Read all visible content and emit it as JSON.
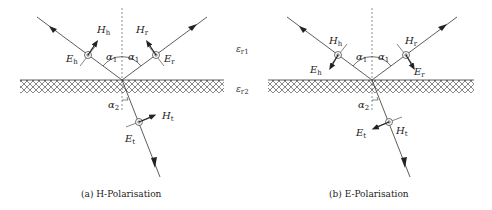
{
  "figure": {
    "media_labels": {
      "medium1": "ε",
      "medium1_sub": "r1",
      "medium2": "ε",
      "medium2_sub": "r2"
    },
    "panels": [
      {
        "id": "a",
        "caption": "(a) H-Polarisation",
        "labels": {
          "incident_H": "H",
          "incident_H_sub": "h",
          "incident_E": "E",
          "incident_E_sub": "h",
          "reflected_H": "H",
          "reflected_H_sub": "r",
          "reflected_E": "E",
          "reflected_E_sub": "r",
          "transmitted_H": "H",
          "transmitted_H_sub": "t",
          "transmitted_E": "E",
          "transmitted_E_sub": "t",
          "angle_incident": "α",
          "angle_incident_sub": "1",
          "angle_reflected": "α",
          "angle_reflected_sub": "1",
          "angle_transmitted": "α",
          "angle_transmitted_sub": "2"
        }
      },
      {
        "id": "b",
        "caption": "(b) E-Polarisation",
        "labels": {
          "incident_H": "H",
          "incident_H_sub": "h",
          "incident_E": "E",
          "incident_E_sub": "h",
          "reflected_H": "H",
          "reflected_H_sub": "r",
          "reflected_E": "E",
          "reflected_E_sub": "r",
          "transmitted_H": "H",
          "transmitted_H_sub": "t",
          "transmitted_E": "E",
          "transmitted_E_sub": "t",
          "angle_incident": "α",
          "angle_incident_sub": "1",
          "angle_reflected": "α",
          "angle_reflected_sub": "1",
          "angle_transmitted": "α",
          "angle_transmitted_sub": "2"
        }
      }
    ],
    "colors": {
      "line": "#333333",
      "hatch": "#555555",
      "background": "#ffffff"
    }
  }
}
